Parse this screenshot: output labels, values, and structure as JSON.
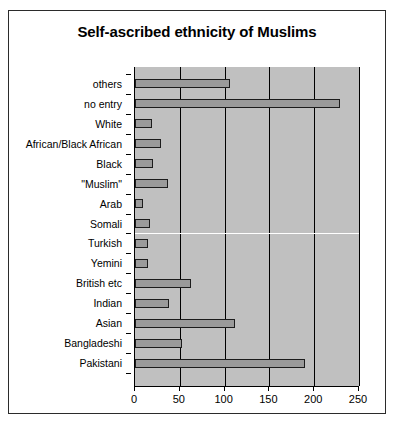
{
  "chart_data": {
    "type": "bar",
    "orientation": "horizontal",
    "title": "Self-ascribed ethnicity of Muslims",
    "xlabel": "",
    "ylabel": "",
    "xlim": [
      0,
      250
    ],
    "xticks": [
      0,
      50,
      100,
      150,
      200,
      250
    ],
    "grid": true,
    "grid_axis": "x",
    "legend": false,
    "plot_background": "#c0c0c0",
    "bar_fill": "#9a9a9a",
    "bar_edge": "#1c1c1c",
    "categories": [
      "others",
      "no entry",
      "White",
      "African/Black African",
      "Black",
      "\"Muslim\"",
      "Arab",
      "Somali",
      "Turkish",
      "Yemini",
      "British etc",
      "Indian",
      "Asian",
      "Bangladeshi",
      "Pakistani"
    ],
    "values": [
      106,
      229,
      19,
      29,
      20,
      37,
      9,
      17,
      15,
      14,
      62,
      38,
      112,
      52,
      190
    ]
  }
}
